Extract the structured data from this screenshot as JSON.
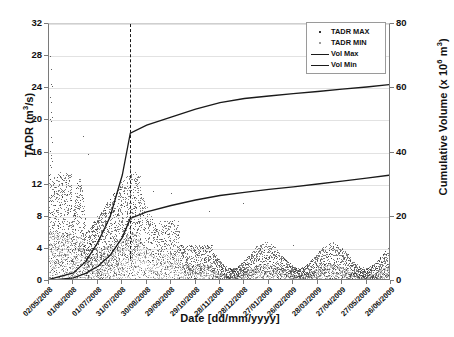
{
  "chart_data": {
    "type": "scatter",
    "title": "",
    "xlabel": "Date [dd/mm/yyyy]",
    "ylabel": "TADR (m3/s)",
    "ylabel_right": "Cumulative Volume (x 106 m3)",
    "ylim": [
      0,
      32
    ],
    "ylim_right": [
      0,
      80
    ],
    "yticks": [
      0,
      4,
      8,
      12,
      16,
      20,
      24,
      28,
      32
    ],
    "yticks_right": [
      0,
      20,
      40,
      60,
      80
    ],
    "grid": true,
    "legend_position": "top-right",
    "xticks": [
      "02/05/2008",
      "01/06/2008",
      "01/07/2008",
      "31/07/2008",
      "30/08/2008",
      "29/09/2008",
      "29/10/2008",
      "28/11/2008",
      "28/12/2008",
      "27/01/2009",
      "26/02/2009",
      "28/03/2009",
      "27/04/2009",
      "27/05/2009",
      "26/06/2009"
    ],
    "annotations": [
      {
        "text": "End of Simulation",
        "x": "01/08/2008",
        "type": "vertical-dashed-line"
      }
    ],
    "series": [
      {
        "name": "TADR MAX",
        "type": "scatter",
        "color": "#2e2e2e",
        "axis": "left",
        "description": "Dense daily maximum time-averaged discharge rate scatter; early May 2008 outliers up to 28 m3/s, main envelope peaking near 13-14 m3/s during Jun-Aug 2008, declining to 1-4 m3/s through 2009."
      },
      {
        "name": "TADR MIN",
        "type": "scatter",
        "color": "#a6a6a6",
        "axis": "left",
        "description": "Daily minimum time-averaged discharge rate scatter; envelope peaking near 6-7 m3/s mid-2008, mostly below 2 m3/s in 2009."
      },
      {
        "name": "Vol Max",
        "type": "line",
        "color": "#1a1a1a",
        "axis": "right",
        "x": [
          "02/05/2008",
          "01/06/2008",
          "16/06/2008",
          "01/07/2008",
          "16/07/2008",
          "31/07/2008",
          "10/08/2008",
          "30/08/2008",
          "29/09/2008",
          "29/10/2008",
          "28/11/2008",
          "28/12/2008",
          "27/01/2009",
          "26/02/2009",
          "28/03/2009",
          "27/04/2009",
          "27/05/2009",
          "26/06/2009"
        ],
        "values": [
          0.5,
          2.5,
          6.0,
          12.0,
          20.0,
          33.0,
          46.0,
          48.5,
          51.0,
          53.5,
          55.5,
          56.8,
          57.6,
          58.3,
          59.0,
          59.7,
          60.4,
          61.2
        ]
      },
      {
        "name": "Vol Min",
        "type": "line",
        "color": "#1a1a1a",
        "axis": "right",
        "x": [
          "02/05/2008",
          "01/06/2008",
          "16/06/2008",
          "01/07/2008",
          "16/07/2008",
          "31/07/2008",
          "10/08/2008",
          "30/08/2008",
          "29/09/2008",
          "29/10/2008",
          "28/11/2008",
          "28/12/2008",
          "27/01/2009",
          "26/02/2009",
          "28/03/2009",
          "27/04/2009",
          "27/05/2009",
          "26/06/2009"
        ],
        "values": [
          0.2,
          1.0,
          2.4,
          4.6,
          8.0,
          13.5,
          19.5,
          21.5,
          23.5,
          25.2,
          26.6,
          27.6,
          28.5,
          29.3,
          30.2,
          31.1,
          32.0,
          33.0
        ]
      }
    ]
  },
  "legend": {
    "items": [
      {
        "label": "TADR MAX",
        "marker": "dot-dark"
      },
      {
        "label": "TADR MIN",
        "marker": "dot-light"
      },
      {
        "label": "Vol Max",
        "marker": "line"
      },
      {
        "label": "Vol Min",
        "marker": "line"
      }
    ]
  },
  "annotation": {
    "end_of_simulation_line1": "End of",
    "end_of_simulation_line2": "Simulation"
  },
  "axis_labels": {
    "left_pre": "TADR (m",
    "left_sup": "3",
    "left_post": "/s)",
    "right_pre": "Cumulative Volume (x 10",
    "right_sup": "6",
    "right_mid": " m",
    "right_sup2": "3",
    "right_post": ")",
    "x": "Date [dd/mm/yyyy]"
  }
}
